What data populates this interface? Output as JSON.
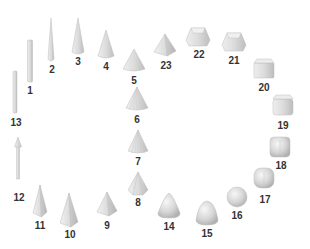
{
  "diagram": {
    "title": "",
    "colors": {
      "fill_light": "#f0f0f0",
      "fill_mid": "#d6d6d6",
      "fill_dark": "#b8b8b8",
      "stroke": "#c4c4c4",
      "label": "#333333"
    },
    "items": [
      {
        "id": "1",
        "label": "1",
        "shape": "thin-rod",
        "x": 30,
        "y": 40,
        "w": 5,
        "h": 42,
        "lx": 30,
        "ly": 86
      },
      {
        "id": "2",
        "label": "2",
        "shape": "needle-cone",
        "x": 51,
        "y": 18,
        "w": 6,
        "h": 43,
        "lx": 52,
        "ly": 65
      },
      {
        "id": "3",
        "label": "3",
        "shape": "slim-cone",
        "x": 78,
        "y": 18,
        "w": 12,
        "h": 36,
        "lx": 78,
        "ly": 57
      },
      {
        "id": "4",
        "label": "4",
        "shape": "cone",
        "x": 106,
        "y": 30,
        "w": 16,
        "h": 28,
        "lx": 106,
        "ly": 62
      },
      {
        "id": "5",
        "label": "5",
        "shape": "wide-cone",
        "x": 134,
        "y": 49,
        "w": 22,
        "h": 22,
        "lx": 134,
        "ly": 76
      },
      {
        "id": "6",
        "label": "6",
        "shape": "faceted-cone",
        "x": 137,
        "y": 87,
        "w": 22,
        "h": 23,
        "lx": 137,
        "ly": 115
      },
      {
        "id": "7",
        "label": "7",
        "shape": "faceted-cone",
        "x": 138,
        "y": 130,
        "w": 20,
        "h": 23,
        "lx": 138,
        "ly": 157
      },
      {
        "id": "8",
        "label": "8",
        "shape": "hex-pyramid",
        "x": 138,
        "y": 172,
        "w": 20,
        "h": 23,
        "lx": 138,
        "ly": 198
      },
      {
        "id": "9",
        "label": "9",
        "shape": "pyramid",
        "x": 107,
        "y": 192,
        "w": 20,
        "h": 24,
        "lx": 107,
        "ly": 221
      },
      {
        "id": "10",
        "label": "10",
        "shape": "tall-pyramid",
        "x": 69,
        "y": 193,
        "w": 18,
        "h": 34,
        "lx": 70,
        "ly": 230
      },
      {
        "id": "11",
        "label": "11",
        "shape": "slim-pyramid",
        "x": 40,
        "y": 185,
        "w": 14,
        "h": 32,
        "lx": 40,
        "ly": 221
      },
      {
        "id": "12",
        "label": "12",
        "shape": "arrow-rod",
        "x": 18,
        "y": 137,
        "w": 5,
        "h": 42,
        "lx": 19,
        "ly": 193
      },
      {
        "id": "13",
        "label": "13",
        "shape": "thin-rod",
        "x": 15,
        "y": 71,
        "w": 4,
        "h": 42,
        "lx": 16,
        "ly": 118
      },
      {
        "id": "14",
        "label": "14",
        "shape": "rounded-cone",
        "x": 169,
        "y": 193,
        "w": 22,
        "h": 25,
        "lx": 169,
        "ly": 222
      },
      {
        "id": "15",
        "label": "15",
        "shape": "rounded-triangle",
        "x": 207,
        "y": 201,
        "w": 22,
        "h": 24,
        "lx": 207,
        "ly": 229
      },
      {
        "id": "16",
        "label": "16",
        "shape": "sphere",
        "x": 237,
        "y": 187,
        "w": 20,
        "h": 20,
        "lx": 237,
        "ly": 211
      },
      {
        "id": "17",
        "label": "17",
        "shape": "rounded-cube",
        "x": 264,
        "y": 168,
        "w": 20,
        "h": 20,
        "lx": 265,
        "ly": 195
      },
      {
        "id": "18",
        "label": "18",
        "shape": "soft-cube",
        "x": 280,
        "y": 137,
        "w": 20,
        "h": 20,
        "lx": 281,
        "ly": 161
      },
      {
        "id": "19",
        "label": "19",
        "shape": "bevel-cube",
        "x": 283,
        "y": 95,
        "w": 20,
        "h": 20,
        "lx": 283,
        "ly": 121
      },
      {
        "id": "20",
        "label": "20",
        "shape": "cube",
        "x": 264,
        "y": 59,
        "w": 20,
        "h": 19,
        "lx": 264,
        "ly": 83
      },
      {
        "id": "21",
        "label": "21",
        "shape": "frustum-square",
        "x": 234,
        "y": 33,
        "w": 24,
        "h": 18,
        "lx": 234,
        "ly": 56
      },
      {
        "id": "22",
        "label": "22",
        "shape": "frustum-square",
        "x": 198,
        "y": 28,
        "w": 24,
        "h": 18,
        "lx": 199,
        "ly": 50
      },
      {
        "id": "23",
        "label": "23",
        "shape": "square-pyramid",
        "x": 165,
        "y": 34,
        "w": 22,
        "h": 22,
        "lx": 166,
        "ly": 61
      }
    ]
  }
}
